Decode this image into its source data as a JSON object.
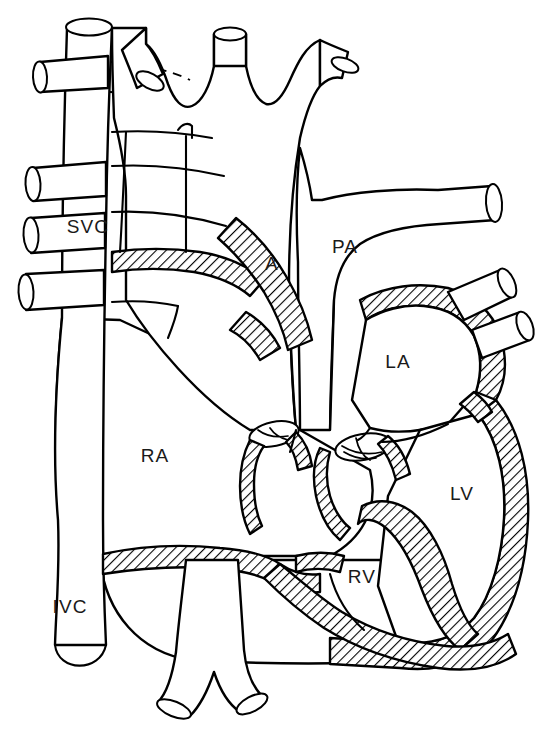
{
  "diagram": {
    "style": "black-and-white line drawing with diagonal hatched myocardial walls",
    "background_color": "#ffffff",
    "line_color": "#000000",
    "label_color": "#1a1a1a",
    "width": 546,
    "height": 730
  },
  "labels": [
    {
      "id": "svc",
      "text": "SVC",
      "name": "superior vena cava",
      "x": 88,
      "y": 228
    },
    {
      "id": "a",
      "text": "A",
      "name": "aorta",
      "x": 272,
      "y": 265
    },
    {
      "id": "pa",
      "text": "PA",
      "name": "pulmonary artery",
      "x": 345,
      "y": 248
    },
    {
      "id": "la",
      "text": "LA",
      "name": "left atrium",
      "x": 398,
      "y": 363
    },
    {
      "id": "ra",
      "text": "RA",
      "name": "right atrium",
      "x": 155,
      "y": 457
    },
    {
      "id": "lv",
      "text": "LV",
      "name": "left ventricle",
      "x": 462,
      "y": 495
    },
    {
      "id": "rv",
      "text": "RV",
      "name": "right ventricle",
      "x": 362,
      "y": 578
    },
    {
      "id": "ivc",
      "text": "IVC",
      "name": "inferior vena cava",
      "x": 70,
      "y": 608
    }
  ],
  "structures": {
    "great_vessels": [
      "superior vena cava trunk",
      "inferior vena cava trunk",
      "aortic arch with three head-and-neck branches",
      "main pulmonary artery with right pulmonary artery branch",
      "two right pulmonary veins entering left atrium",
      "three systemic tributaries entering superior vena cava",
      "descending bifurcating vessel at lower margin"
    ],
    "chambers": [
      "right atrium",
      "right ventricle",
      "left atrium",
      "left ventricle"
    ],
    "valves": [
      "tricuspid valve (open ellipse with leaflets)",
      "mitral valve (open ellipse with leaflets)"
    ],
    "wall_treatment": "diagonal hatch fill indicating myocardium and atrial walls"
  }
}
